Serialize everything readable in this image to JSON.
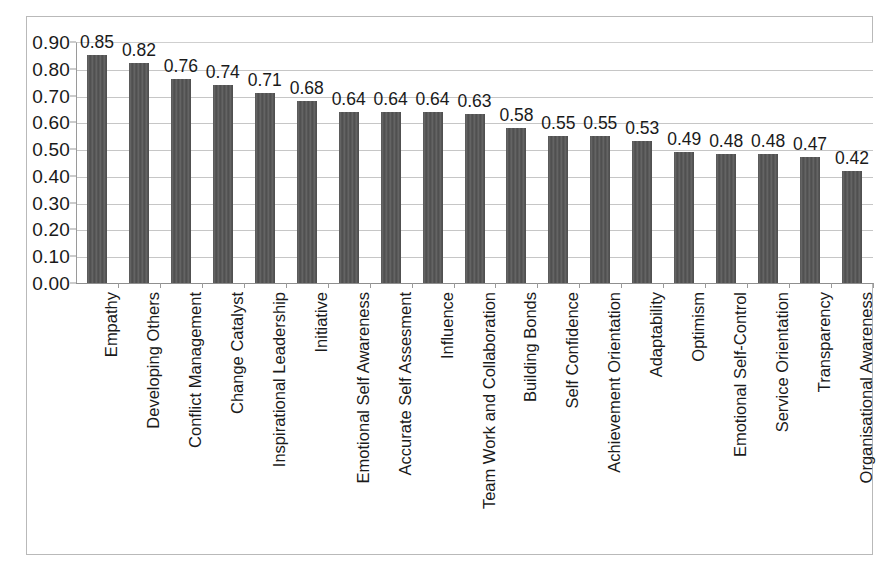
{
  "chart_data": {
    "type": "bar",
    "title": "",
    "subtitle": "",
    "xlabel": "",
    "ylabel": "",
    "ylim": [
      0.0,
      0.9
    ],
    "ytick_labels": [
      "0.90",
      "0.80",
      "0.70",
      "0.60",
      "0.50",
      "0.40",
      "0.30",
      "0.20",
      "0.10",
      "0.00"
    ],
    "ytick_values": [
      0.9,
      0.8,
      0.7,
      0.6,
      0.5,
      0.4,
      0.3,
      0.2,
      0.1,
      0.0
    ],
    "grid": true,
    "legend": false,
    "legend_position": "none",
    "bar_color": "#585858",
    "gridline_color": "#c6c6c6",
    "axis_color": "#9a9a9a",
    "categories": [
      "Empathy",
      "Developing Others",
      "Conflict Management",
      "Change Catalyst",
      "Inspirational Leadership",
      "Initiative",
      "Emotional Self Awareness",
      "Accurate Self Assesment",
      "Influence",
      "Team Work and Collaboration",
      "Building Bonds",
      "Self Confidence",
      "Achievement Orientation",
      "Adaptability",
      "Optimism",
      "Emotional Self-Control",
      "Service Orientation",
      "Transparency",
      "Organisational Awareness"
    ],
    "values": [
      0.85,
      0.82,
      0.76,
      0.74,
      0.71,
      0.68,
      0.64,
      0.64,
      0.64,
      0.63,
      0.58,
      0.55,
      0.55,
      0.53,
      0.49,
      0.48,
      0.48,
      0.47,
      0.42
    ],
    "data_labels": [
      "0.85",
      "0.82",
      "0.76",
      "0.74",
      "0.71",
      "0.68",
      "0.64",
      "0.64",
      "0.64",
      "0.63",
      "0.58",
      "0.55",
      "0.55",
      "0.53",
      "0.49",
      "0.48",
      "0.48",
      "0.47",
      "0.42"
    ]
  }
}
